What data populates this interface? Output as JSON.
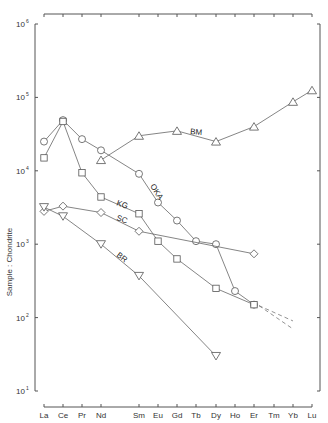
{
  "chart_data": {
    "type": "line",
    "title": "",
    "xlabel": "",
    "ylabel": "Sample : Chondrite",
    "yscale": "log",
    "ylim": [
      10,
      1000000
    ],
    "yticks": [
      {
        "base": "10",
        "exp": "6",
        "value": 1000000
      },
      {
        "base": "10",
        "exp": "5",
        "value": 100000
      },
      {
        "base": "10",
        "exp": "4",
        "value": 10000
      },
      {
        "base": "10",
        "exp": "3",
        "value": 1000
      },
      {
        "base": "10",
        "exp": "2",
        "value": 100
      },
      {
        "base": "10",
        "exp": "1",
        "value": 10
      }
    ],
    "categories": [
      "La",
      "Ce",
      "Pr",
      "Nd",
      "Sm",
      "Eu",
      "Gd",
      "Tb",
      "Dy",
      "Ho",
      "Er",
      "Tm",
      "Yb",
      "Lu"
    ],
    "grid": false,
    "legend": "inline labels on lines",
    "series": [
      {
        "name": "OKA",
        "marker": "circle",
        "points": {
          "La": 25000,
          "Ce": 49000,
          "Pr": 27000,
          "Nd": 19000,
          "Sm": 9100,
          "Eu": 3700,
          "Gd": 2100,
          "Tb": 1100,
          "Dy": 1000,
          "Ho": 230,
          "Er": 150
        },
        "dashed_extension": {
          "to": "Yb",
          "value": 90
        }
      },
      {
        "name": "KG",
        "marker": "square",
        "points": {
          "La": 15000,
          "Ce": 47000,
          "Pr": 9400,
          "Nd": 4400,
          "Sm": 2600,
          "Eu": 1100,
          "Gd": 630,
          "Dy": 250,
          "Er": 150
        },
        "dashed_extension": {
          "to": "Yb",
          "value": 70
        }
      },
      {
        "name": "BM",
        "marker": "triangle-up",
        "points": {
          "Nd": 14000,
          "Sm": 30000,
          "Gd": 35000,
          "Dy": 25000,
          "Er": 40000,
          "Yb": 87000,
          "Lu": 125000
        }
      },
      {
        "name": "SC",
        "marker": "diamond",
        "points": {
          "La": 2800,
          "Ce": 3300,
          "Nd": 2700,
          "Sm": 1500,
          "Er": 740
        }
      },
      {
        "name": "BR",
        "marker": "triangle-down",
        "points": {
          "La": 3200,
          "Ce": 2400,
          "Nd": 1000,
          "Sm": 370,
          "Dy": 30
        }
      }
    ]
  }
}
